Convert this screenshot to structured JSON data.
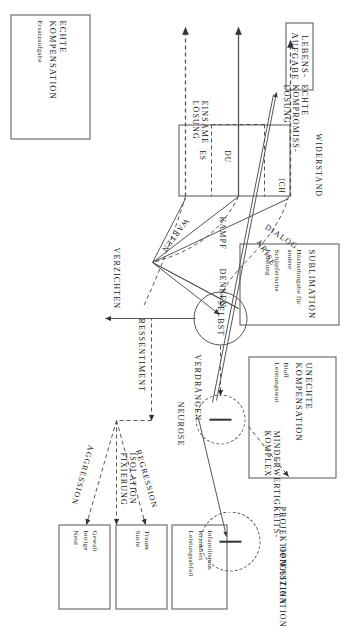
{
  "diagram": {
    "language": "de",
    "orientation": "rotated-90",
    "boxes": [
      {
        "id": "lebensaufgabe",
        "title": "LEBENS-\nAUFGABE",
        "lines": []
      },
      {
        "id": "echte_komp",
        "title": "ECHTE\nKOMPENSATION",
        "lines": [
          "Ersatzaufgabe"
        ]
      },
      {
        "id": "sublimation",
        "title": "SUBLIMATION",
        "lines": [
          "Höchsthingabe für",
          "andere",
          "Schöpferische",
          "Leistung"
        ]
      },
      {
        "id": "unechte_komp",
        "title": "UNECHTE\nKOMPENSATION",
        "lines": [
          "Bluff",
          "Leistungswut"
        ]
      },
      {
        "id": "widerstand_band",
        "title": "",
        "lines": []
      },
      {
        "id": "out_aggression",
        "title": "",
        "lines": [
          "Gewalt",
          "Intrige",
          "Neid"
        ]
      },
      {
        "id": "out_isolation",
        "title": "",
        "lines": [
          "Traum",
          "Sucht"
        ]
      },
      {
        "id": "out_regression",
        "title": "",
        "lines": [
          "Infantilismus",
          "Krankheit",
          "Leistungsabfall"
        ]
      }
    ],
    "circles": [
      {
        "id": "selbst",
        "label": "SELBST",
        "mark": "none"
      },
      {
        "id": "neurose",
        "label": "",
        "mark": "minus"
      },
      {
        "id": "projektion",
        "label": "",
        "mark": "minus"
      }
    ],
    "labels": {
      "widerstand": "WIDERSTAND",
      "ich": "ICH",
      "du": "DU",
      "es": "ES",
      "echte_kompromiss_loesung": "ECHTE\nKOMPROMISS-\nLÖSUNG",
      "einsame_loesung": "EINSAME\nLÖSUNG",
      "krise": "KRISE",
      "dialog": "DIALOG",
      "kampf": "KAMPF",
      "warten": "WARTEN",
      "denken": "DENKEN",
      "verzichten": "VERZICHTEN",
      "ressentiment": "RESSENTIMENT",
      "verdraengen": "VERDRÄNGEN",
      "neurose": "NEUROSE",
      "minderwertigkeits_komplex": "MINDERWERTIGKEITS-\nKOMPLEX",
      "projektion": "PROJEKTION",
      "opposition": "OPPOSITION",
      "faszination": "FASZINATION",
      "aggression": "AGGRESSION",
      "isolation_fixierung": "ISOLATION\nFIXIERUNG",
      "regression": "REGRESSION"
    },
    "colors": {
      "ink": "#1a1a1a",
      "stroke": "#555555",
      "paper": "#ffffff"
    }
  }
}
